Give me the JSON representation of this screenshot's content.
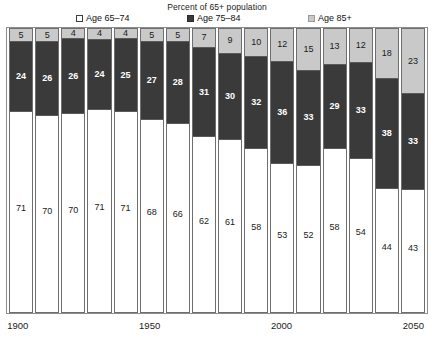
{
  "chart_title": "Percent of 65+ population",
  "legend": {
    "items": [
      {
        "label": "Age 65–74",
        "swatch": "white-swatch-icon",
        "color": "#ffffff"
      },
      {
        "label": "Age 75–84",
        "swatch": "dark-swatch-icon",
        "color": "#3a3a3a"
      },
      {
        "label": "Age 85+",
        "swatch": "light-swatch-icon",
        "color": "#c9c9c9"
      }
    ]
  },
  "x_axis": {
    "tick_labels": [
      "1900",
      "1950",
      "2000",
      "2050"
    ]
  },
  "chart_data": {
    "type": "bar",
    "subtype": "stacked-column-100-percent",
    "title": "Percent of 65+ population",
    "xlabel": "",
    "ylabel": "",
    "ylim": [
      0,
      100
    ],
    "grid": false,
    "legend_position": "top",
    "categories": [
      "1900",
      "1910",
      "1920",
      "1930",
      "1940",
      "1950",
      "1960",
      "1970",
      "1980",
      "1990",
      "2000",
      "2010",
      "2020",
      "2030",
      "2040",
      "2050"
    ],
    "x_tick_labels_shown": [
      "1900",
      "1950",
      "2000",
      "2050"
    ],
    "series": [
      {
        "name": "Age 65–74",
        "color": "#ffffff",
        "values": [
          71,
          70,
          70,
          71,
          71,
          68,
          66,
          62,
          61,
          58,
          53,
          52,
          58,
          54,
          44,
          43
        ]
      },
      {
        "name": "Age 75–84",
        "color": "#3a3a3a",
        "values": [
          24,
          26,
          26,
          24,
          25,
          27,
          28,
          31,
          30,
          32,
          36,
          33,
          29,
          33,
          38,
          33
        ]
      },
      {
        "name": "Age 85+",
        "color": "#c9c9c9",
        "values": [
          5,
          5,
          4,
          4,
          4,
          5,
          5,
          7,
          9,
          10,
          12,
          15,
          13,
          12,
          18,
          23
        ]
      }
    ]
  }
}
